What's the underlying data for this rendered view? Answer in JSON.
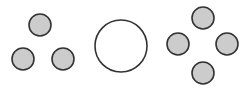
{
  "figure": {
    "width": 247,
    "height": 100,
    "background_color": "#ffffff",
    "small_circle_fill": "#cccccc",
    "small_circle_stroke": "#333333",
    "small_circle_stroke_width": 1.6,
    "large_circle_fill": "#ffffff",
    "large_circle_stroke": "#333333",
    "large_circle_stroke_width": 1.6
  },
  "groups": [
    {
      "id": "left-group",
      "name": "left-triangle-group",
      "arrangement": "triangle",
      "count": 3,
      "fill": "#cccccc",
      "stroke": "#333333",
      "circles": [
        {
          "name": "left-circle-top",
          "cx": 40,
          "cy": 25,
          "r": 11
        },
        {
          "name": "left-circle-bottom-left",
          "cx": 23,
          "cy": 59,
          "r": 11
        },
        {
          "name": "left-circle-bottom-right",
          "cx": 63,
          "cy": 59,
          "r": 11
        }
      ]
    },
    {
      "id": "center-group",
      "name": "center-large-circle-group",
      "arrangement": "single",
      "count": 1,
      "fill": "#ffffff",
      "stroke": "#333333",
      "circles": [
        {
          "name": "center-large-circle",
          "cx": 121,
          "cy": 46,
          "r": 26
        }
      ]
    },
    {
      "id": "right-group",
      "name": "right-diamond-group",
      "arrangement": "diamond",
      "count": 4,
      "fill": "#cccccc",
      "stroke": "#333333",
      "circles": [
        {
          "name": "right-circle-top",
          "cx": 203,
          "cy": 18,
          "r": 11
        },
        {
          "name": "right-circle-left",
          "cx": 178,
          "cy": 44,
          "r": 11
        },
        {
          "name": "right-circle-right",
          "cx": 227,
          "cy": 44,
          "r": 11
        },
        {
          "name": "right-circle-bottom",
          "cx": 203,
          "cy": 73,
          "r": 11
        }
      ]
    }
  ]
}
